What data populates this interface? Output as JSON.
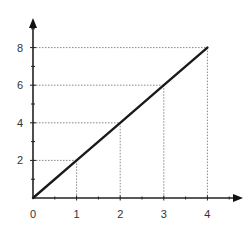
{
  "chart_data": {
    "type": "line",
    "title": "",
    "xlabel": "",
    "ylabel": "",
    "x": [
      0,
      1,
      2,
      3,
      4
    ],
    "series": [
      {
        "name": "y = 2x",
        "values": [
          0,
          2,
          4,
          6,
          8
        ]
      }
    ],
    "x_ticks": [
      "0",
      "1",
      "2",
      "3",
      "4"
    ],
    "y_ticks": [
      "2",
      "4",
      "6",
      "8"
    ],
    "xlim": [
      0,
      4.75
    ],
    "ylim": [
      0,
      9.5
    ],
    "grid": false,
    "guide_lines": "dotted projections from points (1,2),(2,4),(3,6),(4,8) to both axes",
    "legend": null,
    "colors": {
      "line": "#1a1a1a",
      "axis": "#222222",
      "guide": "#888888"
    }
  }
}
